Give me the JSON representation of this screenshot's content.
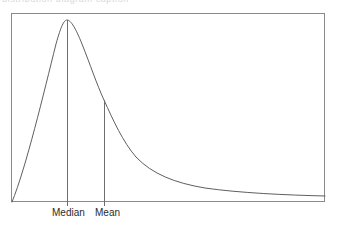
{
  "figure": {
    "name": "skewed-distribution-curve",
    "clipped_caption_text": "distribution diagram caption",
    "frame": {
      "x": 11,
      "y": 13,
      "width": 314,
      "height": 189,
      "stroke": "#8a8a8a",
      "stroke_width": 1,
      "fill": "#ffffff"
    },
    "curve": {
      "stroke": "#5f5f5f",
      "stroke_width": 1,
      "path": "M 12 202 C 26 168 44 92 56 44 C 61 26 64 20 67 20 C 71 20 76 29 82 44 C 90 64 97 85 104 100 C 113 120 123 142 136 157 C 152 174 175 183 205 188 C 240 193 285 195 325 196"
    },
    "markers": [
      {
        "id": "median",
        "label": "Median",
        "x": 67,
        "y_top": 20,
        "y_bottom": 206,
        "stroke": "#6e6e6e",
        "stroke_width": 1
      },
      {
        "id": "mean",
        "label": "Mean",
        "x": 104,
        "y_top": 100,
        "y_bottom": 206,
        "stroke": "#6e6e6e",
        "stroke_width": 1
      }
    ]
  },
  "chart_data": {
    "type": "line",
    "title": "",
    "subtitle": "",
    "xlabel": "",
    "ylabel": "",
    "grid": false,
    "legend": "none",
    "xlim": [
      0,
      100
    ],
    "ylim": [
      0,
      100
    ],
    "series": [
      {
        "name": "Density",
        "x": [
          0,
          5,
          10,
          15,
          18,
          20,
          25,
          30,
          35,
          40,
          45,
          50,
          55,
          60,
          65,
          70,
          75,
          80,
          85,
          90,
          95,
          100
        ],
        "values": [
          0,
          17,
          40,
          70,
          90,
          100,
          90,
          72,
          54,
          40,
          30,
          23,
          17,
          13,
          10,
          8,
          7,
          6,
          5,
          4,
          3.5,
          3
        ]
      }
    ],
    "annotations": [
      {
        "label": "Median",
        "x": 18,
        "type": "vertical-line",
        "y_from": 0,
        "y_to": 100
      },
      {
        "label": "Mean",
        "x": 30,
        "type": "vertical-line",
        "y_from": 0,
        "y_to": 54
      }
    ],
    "tick_labels": [
      "Median",
      "Mean"
    ],
    "colors": {
      "curve": "#5f5f5f",
      "frame": "#8a8a8a",
      "marker_line": "#6e6e6e",
      "label_text": "#2b2b2b",
      "background": "#ffffff"
    }
  }
}
